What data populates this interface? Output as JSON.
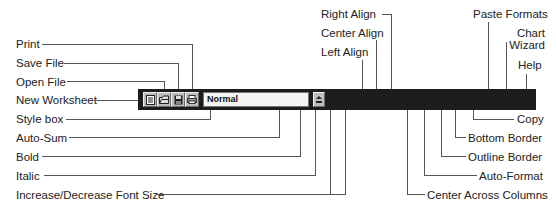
{
  "toolbar": {
    "style_box_value": "Normal",
    "buttons": [
      {
        "name": "new-worksheet",
        "icon": "new-sheet-icon"
      },
      {
        "name": "open-file",
        "icon": "folder-open-icon"
      },
      {
        "name": "save-file",
        "icon": "floppy-disk-icon"
      },
      {
        "name": "print",
        "icon": "printer-icon"
      },
      {
        "name": "style-dropdown",
        "icon": "dropdown-arrow-icon"
      },
      {
        "name": "auto-sum",
        "icon": "sigma-icon",
        "glyph": "Σ"
      },
      {
        "name": "bold",
        "icon": "bold-icon",
        "glyph": "B"
      },
      {
        "name": "italic",
        "icon": "italic-icon",
        "glyph": "I"
      },
      {
        "name": "increase-font-size",
        "icon": "large-a-icon",
        "glyph": "A"
      },
      {
        "name": "decrease-font-size",
        "icon": "small-a-icon",
        "glyph": "A"
      },
      {
        "name": "left-align",
        "icon": "align-left-icon"
      },
      {
        "name": "center-align",
        "icon": "align-center-icon"
      },
      {
        "name": "right-align",
        "icon": "align-right-icon"
      },
      {
        "name": "center-across-columns",
        "icon": "center-across-icon"
      },
      {
        "name": "auto-format",
        "icon": "table-format-icon"
      },
      {
        "name": "outline-border",
        "icon": "outline-border-icon"
      },
      {
        "name": "bottom-border",
        "icon": "bottom-border-icon"
      },
      {
        "name": "copy",
        "icon": "copy-icon"
      },
      {
        "name": "paste-formats",
        "icon": "paste-formats-icon"
      },
      {
        "name": "chart-wizard",
        "icon": "chart-wizard-icon"
      },
      {
        "name": "help",
        "icon": "help-pointer-icon"
      }
    ]
  },
  "labels": {
    "print": "Print",
    "save_file": "Save File",
    "open_file": "Open File",
    "new_worksheet": "New Worksheet",
    "style_box": "Style box",
    "auto_sum": "Auto-Sum",
    "bold": "Bold",
    "italic": "Italic",
    "font_size": "Increase/Decrease Font Size",
    "right_align": "Right Align",
    "center_align": "Center Align",
    "left_align": "Left Align",
    "paste_formats": "Paste Formats",
    "chart_wizard_line1": "Chart",
    "chart_wizard_line2": "Wizard",
    "help": "Help",
    "copy": "Copy",
    "bottom_border": "Bottom Border",
    "outline_border": "Outline Border",
    "auto_format": "Auto-Format",
    "center_across_columns": "Center Across Columns"
  },
  "colors": {
    "toolbar_bg": "#1c1c1c",
    "button_face": "#bdbdbd",
    "leader_line": "#555555"
  }
}
